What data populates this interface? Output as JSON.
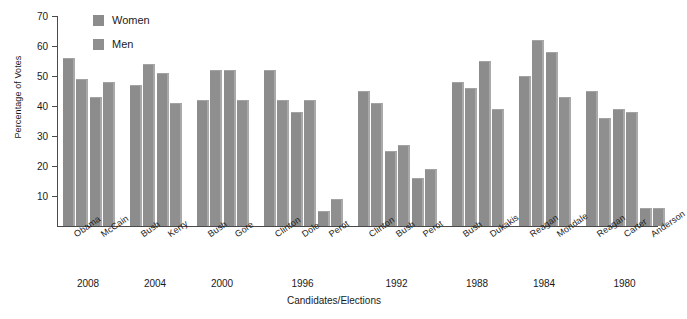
{
  "chart_data": {
    "type": "bar",
    "title": "",
    "xlabel": "Candidates/Elections",
    "ylabel": "Percentage of Votes",
    "ylim": [
      0,
      70
    ],
    "yticks": [
      10,
      20,
      30,
      40,
      50,
      60,
      70
    ],
    "grid": false,
    "legend_position": "top-left",
    "categories": [
      "Obama",
      "McCain",
      "Bush",
      "Kerry",
      "Bush",
      "Gore",
      "Clinton",
      "Dole",
      "Perot",
      "Clinton",
      "Bush",
      "Perot",
      "Bush",
      "Dukakis",
      "Reagan",
      "Mondale",
      "Reagan",
      "Carter",
      "Anderson"
    ],
    "groups": [
      {
        "year": "2008",
        "candidates": [
          "Obama",
          "McCain"
        ]
      },
      {
        "year": "2004",
        "candidates": [
          "Bush",
          "Kerry"
        ]
      },
      {
        "year": "2000",
        "candidates": [
          "Bush",
          "Gore"
        ]
      },
      {
        "year": "1996",
        "candidates": [
          "Clinton",
          "Dole",
          "Perot"
        ]
      },
      {
        "year": "1992",
        "candidates": [
          "Clinton",
          "Bush",
          "Perot"
        ]
      },
      {
        "year": "1988",
        "candidates": [
          "Bush",
          "Dukakis"
        ]
      },
      {
        "year": "1984",
        "candidates": [
          "Reagan",
          "Mondale"
        ]
      },
      {
        "year": "1980",
        "candidates": [
          "Reagan",
          "Carter",
          "Anderson"
        ]
      }
    ],
    "series": [
      {
        "name": "Women",
        "values": [
          56,
          43,
          47,
          51,
          42,
          52,
          52,
          38,
          5,
          45,
          25,
          16,
          48,
          55,
          50,
          58,
          45,
          39,
          6
        ]
      },
      {
        "name": "Men",
        "values": [
          49,
          48,
          54,
          41,
          52,
          42,
          42,
          42,
          9,
          41,
          27,
          19,
          46,
          39,
          62,
          43,
          36,
          38,
          6
        ]
      }
    ]
  },
  "legend": {
    "items": [
      {
        "label": "Women",
        "color": "#8c8c8c"
      },
      {
        "label": "Men",
        "color": "#8f8f8f"
      }
    ]
  },
  "axes": {
    "y_title": "Percentage of Votes",
    "x_title": "Candidates/Elections",
    "y_tick_labels": [
      "70",
      "60",
      "50",
      "40",
      "30",
      "20",
      "10"
    ]
  },
  "caption": {
    "text": ""
  }
}
